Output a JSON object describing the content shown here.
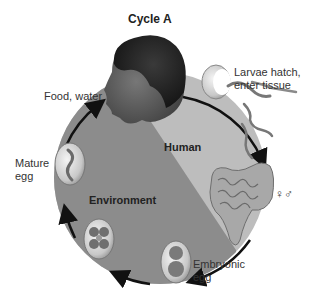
{
  "diagram": {
    "title": "Cycle A",
    "regions": {
      "human": "Human",
      "environment": "Environment"
    },
    "stages": [
      {
        "id": "food-water",
        "label": "Food, water"
      },
      {
        "id": "larvae",
        "label_line1": "Larvae hatch,",
        "label_line2": "enter tissue"
      },
      {
        "id": "adults",
        "label": "♀♂"
      },
      {
        "id": "embryonic-egg",
        "label_line1": "Embryonic",
        "label_line2": "egg"
      },
      {
        "id": "mature-egg",
        "label_line1": "Mature",
        "label_line2": "egg"
      }
    ],
    "colors": {
      "human_region": "#bdbdbd",
      "environment_region": "#8c8c8c",
      "cycle_arrow": "#111111",
      "background": "#ffffff"
    }
  }
}
